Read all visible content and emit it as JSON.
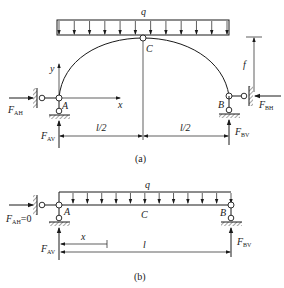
{
  "figure_a": {
    "caption": "(a)",
    "load_label": "q",
    "crown_label": "C",
    "left_support_label": "A",
    "right_support_label": "B",
    "axis_x_label": "x",
    "axis_y_label": "y",
    "rise_label": "f",
    "span_half_left": "l/2",
    "span_half_right": "l/2",
    "forces": {
      "left_horizontal": {
        "main": "F",
        "sub": "AH"
      },
      "left_vertical": {
        "main": "F",
        "sub": "AV"
      },
      "right_horizontal": {
        "main": "F",
        "sub": "BH"
      },
      "right_vertical": {
        "main": "F",
        "sub": "BV"
      }
    },
    "load_arrow_count": 12
  },
  "figure_b": {
    "caption": "(b)",
    "load_label": "q",
    "mid_label": "C",
    "left_support_label": "A",
    "right_support_label": "B",
    "position_label": "x",
    "span_label": "l",
    "forces": {
      "left_horizontal": {
        "main": "F",
        "sub": "AH",
        "suffix": "=0"
      },
      "left_vertical": {
        "main": "F",
        "sub": "AV"
      },
      "right_vertical": {
        "main": "F",
        "sub": "BV"
      }
    },
    "load_arrow_count": 13
  }
}
